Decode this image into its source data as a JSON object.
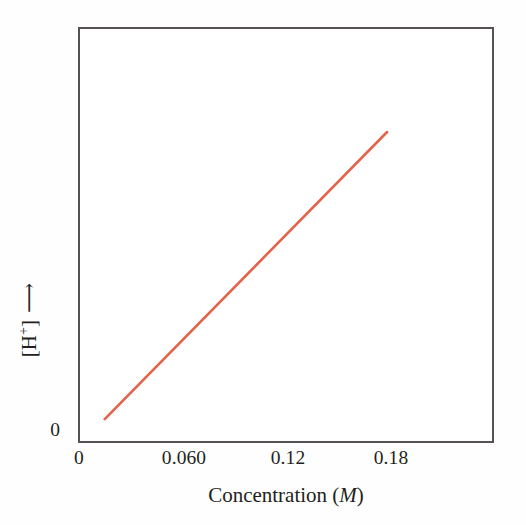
{
  "figure": {
    "background_color": "#fefefe",
    "frame_color": "#555154",
    "text_color": "#231f20"
  },
  "axes": {
    "x": {
      "title_text": "Concentration (",
      "title_symbol": "M",
      "title_close": ")",
      "ticks": [
        {
          "label": "0",
          "value": 0.0
        },
        {
          "label": "0.060",
          "value": 0.06
        },
        {
          "label": "0.12",
          "value": 0.12
        },
        {
          "label": "0.18",
          "value": 0.18
        }
      ]
    },
    "y": {
      "title_bracket_open": "[H",
      "title_superscript": "+",
      "title_bracket_close": "]",
      "arrow_glyph": "⟶",
      "ticks": [
        {
          "label": "0",
          "value": 0.0
        }
      ]
    }
  },
  "chart_data": {
    "type": "line",
    "title": "",
    "subtitle": "",
    "xlabel": "Concentration (M)",
    "ylabel": "[H+]",
    "xlim": [
      0,
      0.2415
    ],
    "ylim": [
      0,
      1.0
    ],
    "grid": false,
    "legend": null,
    "annotations": [],
    "axis_tick_labels": {
      "x": [
        "0",
        "0.060",
        "0.12",
        "0.18"
      ],
      "y": [
        "0"
      ]
    },
    "series": [
      {
        "name": "[H+] vs Concentration",
        "color": "#e4634a",
        "line_width": 2.6,
        "x": [
          0.0145,
          0.18
        ],
        "y": [
          0.0529,
          0.75
        ],
        "relationship": "linear",
        "description": "Straight line of positive slope rising from lower left to upper right"
      }
    ]
  }
}
